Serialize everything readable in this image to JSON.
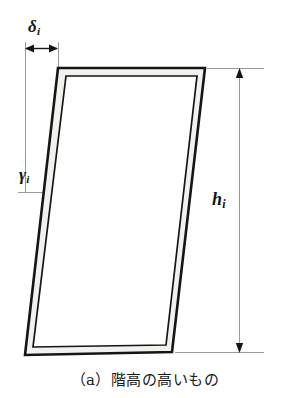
{
  "figure": {
    "caption": "（a）階高の高いもの",
    "labels": {
      "drift_symbol": "δ",
      "drift_subscript": "i",
      "angle_symbol": "γ",
      "angle_subscript": "i",
      "height_symbol": "h",
      "height_subscript": "i"
    },
    "colors": {
      "line": "#151515",
      "thin_line": "#9a9a9a",
      "member_fill": "#f2f1ee",
      "background": "#ffffff",
      "text": "#1a1a1a"
    },
    "geometry": {
      "description": "Leaning portal frame drawn with double lines",
      "outer_quad": "58,68 205,68 172,352 25,355",
      "inner_quad": "66,76 197,76 166,345 33,347",
      "lean_offset_px": 33,
      "story_height_px": 284
    },
    "dimensions": {
      "delta_arrow_y": 48,
      "delta_arrow_x1": 25,
      "delta_arrow_x2": 58,
      "height_line_x": 239,
      "height_arrow_y_top": 70,
      "height_arrow_y_bottom": 352,
      "gamma_tick_y": 192,
      "vertical_datum_x": 25
    }
  }
}
